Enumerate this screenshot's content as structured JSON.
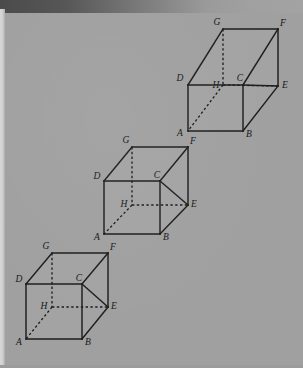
{
  "figure": {
    "background_color": "#a0a0a0",
    "ink_color": "#1d1d1d",
    "label_style": "italic serif",
    "vertex_names": [
      "A",
      "B",
      "C",
      "D",
      "E",
      "F",
      "G",
      "H"
    ],
    "hidden_vertex": "H",
    "hidden_edges": [
      "G-H",
      "H-E",
      "H-A"
    ],
    "projection": "oblique (cavalier)",
    "box_count": 3
  },
  "boxes": [
    {
      "id": "box-top",
      "name": "top-box",
      "shape_note": "wide flat box",
      "vertices": {
        "A": {
          "x": 188,
          "y": 131,
          "label": "A",
          "lx": 180,
          "ly": 134
        },
        "B": {
          "x": 243,
          "y": 131,
          "label": "B",
          "lx": 249,
          "ly": 135
        },
        "C": {
          "x": 243,
          "y": 85,
          "label": "C",
          "lx": 240,
          "ly": 79
        },
        "D": {
          "x": 188,
          "y": 85,
          "label": "D",
          "lx": 180,
          "ly": 79
        },
        "E": {
          "x": 278,
          "y": 86,
          "label": "E",
          "lx": 285,
          "ly": 86
        },
        "F": {
          "x": 278,
          "y": 29,
          "label": "F",
          "lx": 283,
          "ly": 24
        },
        "G": {
          "x": 223,
          "y": 29,
          "label": "G",
          "lx": 217,
          "ly": 23
        },
        "H": {
          "x": 223,
          "y": 85,
          "label": "H",
          "lx": 216,
          "ly": 86
        }
      }
    },
    {
      "id": "box-middle",
      "name": "middle-box",
      "shape_note": "cube",
      "vertices": {
        "A": {
          "x": 104,
          "y": 234,
          "label": "A",
          "lx": 97,
          "ly": 238
        },
        "B": {
          "x": 160,
          "y": 234,
          "label": "B",
          "lx": 166,
          "ly": 238
        },
        "C": {
          "x": 160,
          "y": 181,
          "label": "C",
          "lx": 157,
          "ly": 176
        },
        "D": {
          "x": 104,
          "y": 181,
          "label": "D",
          "lx": 97,
          "ly": 177
        },
        "E": {
          "x": 188,
          "y": 205,
          "label": "E",
          "lx": 194,
          "ly": 205
        },
        "F": {
          "x": 188,
          "y": 147,
          "label": "F",
          "lx": 193,
          "ly": 142
        },
        "G": {
          "x": 132,
          "y": 147,
          "label": "G",
          "lx": 126,
          "ly": 141
        },
        "H": {
          "x": 132,
          "y": 205,
          "label": "H",
          "lx": 124,
          "ly": 205
        }
      }
    },
    {
      "id": "box-bottom",
      "name": "bottom-box",
      "shape_note": "short wide box",
      "vertices": {
        "A": {
          "x": 26,
          "y": 339,
          "label": "A",
          "lx": 19,
          "ly": 343
        },
        "B": {
          "x": 82,
          "y": 339,
          "label": "B",
          "lx": 88,
          "ly": 343
        },
        "C": {
          "x": 82,
          "y": 284,
          "label": "C",
          "lx": 79,
          "ly": 279
        },
        "D": {
          "x": 26,
          "y": 284,
          "label": "D",
          "lx": 19,
          "ly": 280
        },
        "E": {
          "x": 108,
          "y": 307,
          "label": "E",
          "lx": 114,
          "ly": 307
        },
        "F": {
          "x": 108,
          "y": 253,
          "label": "F",
          "lx": 113,
          "ly": 248
        },
        "G": {
          "x": 52,
          "y": 253,
          "label": "G",
          "lx": 46,
          "ly": 247
        },
        "H": {
          "x": 52,
          "y": 307,
          "label": "H",
          "lx": 44,
          "ly": 307
        }
      }
    }
  ]
}
